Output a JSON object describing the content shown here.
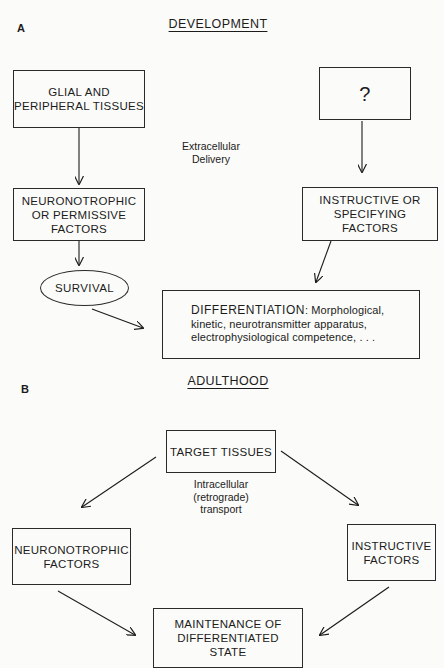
{
  "panel_a": {
    "label": "A",
    "title": "DEVELOPMENT",
    "source_left": [
      "GLIAL AND",
      "PERIPHERAL TISSUES"
    ],
    "source_right": [
      "?"
    ],
    "delivery_note": [
      "Extracellular",
      "Delivery"
    ],
    "factors_left": [
      "NEURONOTROPHIC",
      "OR PERMISSIVE",
      "FACTORS"
    ],
    "factors_right": [
      "INSTRUCTIVE OR",
      "SPECIFYING",
      "FACTORS"
    ],
    "survival": "SURVIVAL",
    "differentiation": {
      "lead": "DIFFERENTIATION",
      "line1_rest": ": Morphological,",
      "line2": "kinetic, neurotransmitter apparatus,",
      "line3": "electrophysiological competence, . . ."
    }
  },
  "panel_b": {
    "label": "B",
    "title": "ADULTHOOD",
    "source": "TARGET TISSUES",
    "transport_note": [
      "Intracellular",
      "(retrograde)",
      "transport"
    ],
    "factors_left": [
      "NEURONOTROPHIC",
      "FACTORS"
    ],
    "factors_right": [
      "INSTRUCTIVE",
      "FACTORS"
    ],
    "outcome": [
      "MAINTENANCE OF",
      "DIFFERENTIATED",
      "STATE"
    ]
  },
  "colors": {
    "ink": "#1c1c1c",
    "paper": "#fbfbf9"
  }
}
